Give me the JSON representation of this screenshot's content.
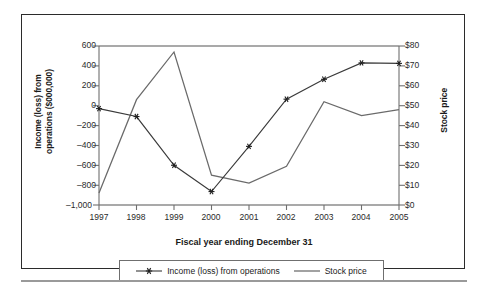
{
  "chart_data": {
    "type": "line",
    "title": "",
    "xlabel": "Fiscal year ending December 31",
    "ylabel": "Income (loss) from operations ($000,000)",
    "ylabel_line1": "Income (loss) from",
    "ylabel_line2": "operations ($000,000)",
    "ylabel_secondary": "Stock price",
    "categories": [
      "1997",
      "1998",
      "1999",
      "2000",
      "2001",
      "2002",
      "2003",
      "2004",
      "2005"
    ],
    "x": [
      1997,
      1998,
      1999,
      2000,
      2001,
      2002,
      2003,
      2004,
      2005
    ],
    "grid": false,
    "legend_position": "bottom",
    "ylim": [
      -1000,
      600
    ],
    "ylim_secondary": [
      0,
      80
    ],
    "yticks": [
      600,
      400,
      200,
      0,
      -200,
      -400,
      -600,
      -800,
      -1000
    ],
    "ytick_labels": [
      "600",
      "400",
      "200",
      "0",
      "–200",
      "–400",
      "–600",
      "–800",
      "–1,000"
    ],
    "yticks_secondary": [
      80,
      70,
      60,
      50,
      40,
      30,
      20,
      10,
      0
    ],
    "ytick_labels_secondary": [
      "$80",
      "$70",
      "$60",
      "$50",
      "$40",
      "$30",
      "$20",
      "$10",
      "$0"
    ],
    "series": [
      {
        "name": "Income (loss) from operations",
        "axis": "left",
        "marker": "asterisk",
        "color": "#3a3a3a",
        "values": [
          -30,
          -110,
          -600,
          -865,
          -410,
          65,
          265,
          430,
          425
        ]
      },
      {
        "name": "Stock price",
        "axis": "right",
        "marker": "none",
        "color": "#6a6a6a",
        "values": [
          6,
          53,
          77,
          15,
          11,
          19.5,
          52,
          45,
          48
        ]
      }
    ]
  },
  "legend": {
    "items": [
      {
        "label": "Income (loss) from operations",
        "marker": "asterisk-line-marker"
      },
      {
        "label": "Stock price",
        "marker": "plain-line-marker"
      }
    ]
  },
  "colors": {
    "frame": "#2b2b2b",
    "axis": "#6f6f6f",
    "series_income": "#3a3a3a",
    "series_stock": "#6a6a6a",
    "text": "#1a1a1a"
  }
}
